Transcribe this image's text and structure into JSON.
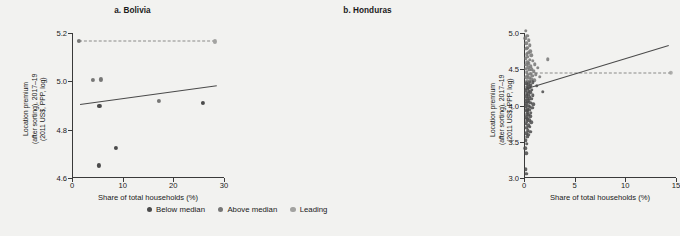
{
  "legend": {
    "items": [
      {
        "label": "Below median",
        "color": "#4b4b4b"
      },
      {
        "label": "Above median",
        "color": "#777776"
      },
      {
        "label": "Leading",
        "color": "#a3a3a1"
      }
    ]
  },
  "chart_data": [
    {
      "type": "scatter",
      "title": "a. Bolivia",
      "xlabel": "Share of total households (%)",
      "ylabel": "Location premium\n(after sorting), 2017–19\n(2011 US$, PPP, log)",
      "xlim": [
        0,
        30
      ],
      "ylim": [
        4.6,
        5.2
      ],
      "xticks": [
        0,
        10,
        20,
        30
      ],
      "yticks": [
        4.6,
        4.8,
        5.0,
        5.2
      ],
      "grid": false,
      "reference_line": {
        "y": 5.165,
        "x_start": 1.3,
        "x_end": 28.2,
        "style": "dashed"
      },
      "fit_line": {
        "x_start": 1.5,
        "y_start": 4.907,
        "x_end": 28.5,
        "y_end": 4.985
      },
      "points": [
        {
          "x": 1.3,
          "y": 5.168,
          "group": "Above median"
        },
        {
          "x": 4.2,
          "y": 5.005,
          "group": "Above median"
        },
        {
          "x": 5.7,
          "y": 5.008,
          "group": "Above median"
        },
        {
          "x": 5.4,
          "y": 4.898,
          "group": "Below median"
        },
        {
          "x": 5.3,
          "y": 4.652,
          "group": "Below median"
        },
        {
          "x": 8.6,
          "y": 4.723,
          "group": "Below median"
        },
        {
          "x": 17.2,
          "y": 4.918,
          "group": "Above median"
        },
        {
          "x": 25.8,
          "y": 4.91,
          "group": "Below median"
        },
        {
          "x": 28.2,
          "y": 5.165,
          "group": "Leading"
        }
      ]
    },
    {
      "type": "scatter",
      "title": "b. Honduras",
      "xlabel": "Share of total households (%)",
      "ylabel": "Location premium\n(after sorting), 2017–19\n(2011 US$, PPP, log)",
      "xlim": [
        0,
        15
      ],
      "ylim": [
        3.0,
        5.0
      ],
      "xticks": [
        0,
        5,
        10,
        15
      ],
      "yticks": [
        3.0,
        3.5,
        4.0,
        4.5,
        5.0
      ],
      "grid": false,
      "reference_line": {
        "y": 4.45,
        "x_start": 0.55,
        "x_end": 14.5,
        "style": "dashed"
      },
      "fit_line": {
        "x_start": 0.3,
        "y_start": 4.235,
        "x_end": 14.3,
        "y_end": 4.83
      },
      "points": [
        {
          "x": 0.18,
          "y": 5.03,
          "group": "Above median"
        },
        {
          "x": 0.3,
          "y": 4.96,
          "group": "Above median"
        },
        {
          "x": 0.14,
          "y": 4.93,
          "group": "Above median"
        },
        {
          "x": 0.46,
          "y": 4.9,
          "group": "Above median"
        },
        {
          "x": 0.22,
          "y": 4.86,
          "group": "Above median"
        },
        {
          "x": 0.55,
          "y": 4.83,
          "group": "Above median"
        },
        {
          "x": 0.33,
          "y": 4.8,
          "group": "Above median"
        },
        {
          "x": 0.2,
          "y": 4.78,
          "group": "Above median"
        },
        {
          "x": 0.62,
          "y": 4.75,
          "group": "Above median"
        },
        {
          "x": 0.42,
          "y": 4.73,
          "group": "Above median"
        },
        {
          "x": 0.25,
          "y": 4.71,
          "group": "Above median"
        },
        {
          "x": 0.7,
          "y": 4.69,
          "group": "Above median"
        },
        {
          "x": 0.38,
          "y": 4.67,
          "group": "Above median"
        },
        {
          "x": 0.16,
          "y": 4.65,
          "group": "Above median"
        },
        {
          "x": 0.58,
          "y": 4.63,
          "group": "Above median"
        },
        {
          "x": 0.86,
          "y": 4.62,
          "group": "Above median"
        },
        {
          "x": 0.3,
          "y": 4.6,
          "group": "Above median"
        },
        {
          "x": 0.48,
          "y": 4.58,
          "group": "Above median"
        },
        {
          "x": 1.05,
          "y": 4.57,
          "group": "Above median"
        },
        {
          "x": 0.24,
          "y": 4.56,
          "group": "Above median"
        },
        {
          "x": 0.66,
          "y": 4.54,
          "group": "Above median"
        },
        {
          "x": 0.4,
          "y": 4.53,
          "group": "Above median"
        },
        {
          "x": 1.35,
          "y": 4.52,
          "group": "Above median"
        },
        {
          "x": 0.18,
          "y": 4.51,
          "group": "Above median"
        },
        {
          "x": 0.78,
          "y": 4.5,
          "group": "Above median"
        },
        {
          "x": 0.52,
          "y": 4.49,
          "group": "Above median"
        },
        {
          "x": 2.35,
          "y": 4.64,
          "group": "Above median"
        },
        {
          "x": 0.95,
          "y": 4.47,
          "group": "Above median"
        },
        {
          "x": 0.28,
          "y": 4.46,
          "group": "Above median"
        },
        {
          "x": 0.6,
          "y": 4.44,
          "group": "Above median"
        },
        {
          "x": 1.15,
          "y": 4.43,
          "group": "Above median"
        },
        {
          "x": 0.36,
          "y": 4.42,
          "group": "Above median"
        },
        {
          "x": 0.82,
          "y": 4.41,
          "group": "Above median"
        },
        {
          "x": 1.55,
          "y": 4.4,
          "group": "Above median"
        },
        {
          "x": 0.22,
          "y": 4.39,
          "group": "Above median"
        },
        {
          "x": 0.5,
          "y": 4.38,
          "group": "Above median"
        },
        {
          "x": 0.72,
          "y": 4.36,
          "group": "Above median"
        },
        {
          "x": 1.02,
          "y": 4.35,
          "group": "Above median"
        },
        {
          "x": 0.32,
          "y": 4.34,
          "group": "Above median"
        },
        {
          "x": 0.58,
          "y": 4.33,
          "group": "Below median"
        },
        {
          "x": 0.88,
          "y": 4.32,
          "group": "Below median"
        },
        {
          "x": 0.2,
          "y": 4.31,
          "group": "Below median"
        },
        {
          "x": 0.44,
          "y": 4.29,
          "group": "Below median"
        },
        {
          "x": 0.68,
          "y": 4.28,
          "group": "Below median"
        },
        {
          "x": 1.25,
          "y": 4.27,
          "group": "Below median"
        },
        {
          "x": 0.26,
          "y": 4.26,
          "group": "Below median"
        },
        {
          "x": 0.54,
          "y": 4.25,
          "group": "Below median"
        },
        {
          "x": 0.34,
          "y": 4.23,
          "group": "Below median"
        },
        {
          "x": 0.76,
          "y": 4.22,
          "group": "Below median"
        },
        {
          "x": 0.18,
          "y": 4.21,
          "group": "Below median"
        },
        {
          "x": 0.46,
          "y": 4.2,
          "group": "Below median"
        },
        {
          "x": 1.85,
          "y": 4.19,
          "group": "Below median"
        },
        {
          "x": 0.62,
          "y": 4.18,
          "group": "Below median"
        },
        {
          "x": 0.28,
          "y": 4.17,
          "group": "Below median"
        },
        {
          "x": 0.4,
          "y": 4.15,
          "group": "Below median"
        },
        {
          "x": 0.84,
          "y": 4.14,
          "group": "Below median"
        },
        {
          "x": 0.22,
          "y": 4.13,
          "group": "Below median"
        },
        {
          "x": 0.56,
          "y": 4.12,
          "group": "Below median"
        },
        {
          "x": 0.36,
          "y": 4.1,
          "group": "Below median"
        },
        {
          "x": 0.7,
          "y": 4.09,
          "group": "Below median"
        },
        {
          "x": 0.16,
          "y": 4.08,
          "group": "Below median"
        },
        {
          "x": 0.48,
          "y": 4.07,
          "group": "Below median"
        },
        {
          "x": 0.3,
          "y": 4.05,
          "group": "Below median"
        },
        {
          "x": 0.64,
          "y": 4.04,
          "group": "Below median"
        },
        {
          "x": 0.24,
          "y": 4.03,
          "group": "Below median"
        },
        {
          "x": 0.92,
          "y": 4.02,
          "group": "Below median"
        },
        {
          "x": 0.42,
          "y": 4.0,
          "group": "Below median"
        },
        {
          "x": 0.18,
          "y": 3.99,
          "group": "Below median"
        },
        {
          "x": 0.58,
          "y": 3.98,
          "group": "Below median"
        },
        {
          "x": 0.8,
          "y": 3.97,
          "group": "Below median"
        },
        {
          "x": 0.32,
          "y": 3.95,
          "group": "Below median"
        },
        {
          "x": 0.52,
          "y": 3.94,
          "group": "Below median"
        },
        {
          "x": 0.2,
          "y": 3.93,
          "group": "Below median"
        },
        {
          "x": 0.38,
          "y": 3.91,
          "group": "Below median"
        },
        {
          "x": 0.68,
          "y": 3.9,
          "group": "Below median"
        },
        {
          "x": 0.26,
          "y": 3.88,
          "group": "Below median"
        },
        {
          "x": 0.46,
          "y": 3.87,
          "group": "Below median"
        },
        {
          "x": 0.6,
          "y": 3.85,
          "group": "Below median"
        },
        {
          "x": 0.22,
          "y": 3.84,
          "group": "Below median"
        },
        {
          "x": 0.34,
          "y": 3.82,
          "group": "Below median"
        },
        {
          "x": 0.5,
          "y": 3.8,
          "group": "Below median"
        },
        {
          "x": 0.28,
          "y": 3.78,
          "group": "Below median"
        },
        {
          "x": 0.74,
          "y": 3.77,
          "group": "Below median"
        },
        {
          "x": 0.18,
          "y": 3.75,
          "group": "Below median"
        },
        {
          "x": 0.4,
          "y": 3.73,
          "group": "Below median"
        },
        {
          "x": 0.56,
          "y": 3.71,
          "group": "Below median"
        },
        {
          "x": 0.24,
          "y": 3.69,
          "group": "Below median"
        },
        {
          "x": 0.36,
          "y": 3.66,
          "group": "Below median"
        },
        {
          "x": 0.62,
          "y": 3.64,
          "group": "Below median"
        },
        {
          "x": 0.2,
          "y": 3.62,
          "group": "Below median"
        },
        {
          "x": 0.44,
          "y": 3.6,
          "group": "Below median"
        },
        {
          "x": 0.3,
          "y": 3.57,
          "group": "Below median"
        },
        {
          "x": 0.16,
          "y": 3.52,
          "group": "Below median"
        },
        {
          "x": 0.26,
          "y": 3.47,
          "group": "Below median"
        },
        {
          "x": 0.14,
          "y": 3.41,
          "group": "Below median"
        },
        {
          "x": 0.22,
          "y": 3.34,
          "group": "Below median"
        },
        {
          "x": 0.16,
          "y": 3.12,
          "group": "Below median"
        },
        {
          "x": 0.2,
          "y": 3.06,
          "group": "Below median"
        },
        {
          "x": 14.5,
          "y": 4.45,
          "group": "Leading"
        }
      ]
    }
  ]
}
